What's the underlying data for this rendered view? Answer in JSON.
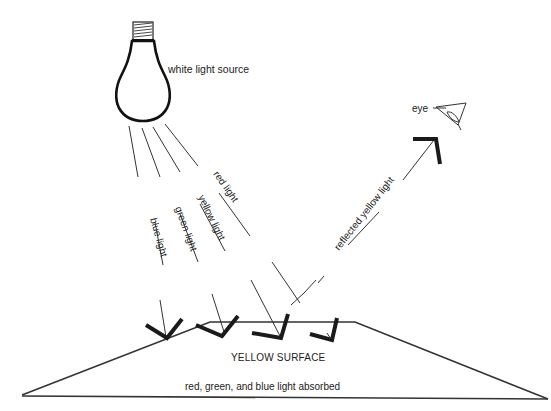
{
  "diagram": {
    "type": "light-reflection-illustration",
    "labels": {
      "light_source": "white light source",
      "red": "red light",
      "yellow": "yellow light",
      "green": "green light",
      "blue": "blue light",
      "reflected": "reflected yellow light",
      "eye": "eye",
      "surface": "YELLOW SURFACE",
      "absorbed": "red, green, and blue light absorbed"
    },
    "incident_rays": [
      {
        "name": "blue light"
      },
      {
        "name": "green light"
      },
      {
        "name": "yellow light"
      },
      {
        "name": "red light"
      }
    ],
    "reflected_rays": [
      {
        "name": "reflected yellow light",
        "target": "eye"
      }
    ]
  }
}
